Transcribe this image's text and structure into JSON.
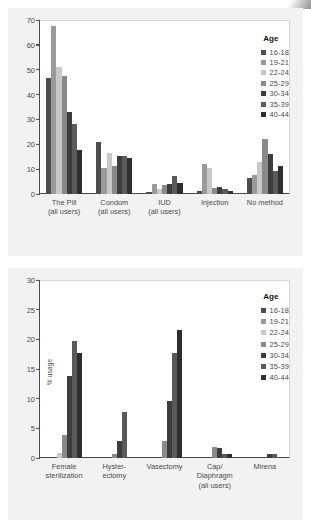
{
  "figure": {
    "background": "#f2f2f2",
    "panel_background": "#ffffff"
  },
  "legend": {
    "title": "Age",
    "entries": [
      {
        "label": "16-18",
        "color": "#4d4d4d"
      },
      {
        "label": "19-21",
        "color": "#9a9a9a"
      },
      {
        "label": "22-24",
        "color": "#c8c8c8"
      },
      {
        "label": "25-29",
        "color": "#8a8a8a"
      },
      {
        "label": "30-34",
        "color": "#3d3d3d"
      },
      {
        "label": "35-39",
        "color": "#5a5a5a"
      },
      {
        "label": "40-44",
        "color": "#2e2e2e"
      }
    ]
  },
  "chart_data": [
    {
      "type": "bar",
      "title": "",
      "xlabel": "",
      "ylabel": "% usage",
      "ylim": [
        0,
        70
      ],
      "yticks": [
        0,
        10,
        20,
        30,
        40,
        50,
        60,
        70
      ],
      "grid": false,
      "legend_position": "top-right",
      "categories": [
        "The Pill\n(all users)",
        "Condom\n(all users)",
        "IUD\n(all users)",
        "Injection",
        "No method"
      ],
      "category_lines": [
        [
          "The Pill",
          "(all users)"
        ],
        [
          "Condom",
          "(all users)"
        ],
        [
          "IUD",
          "(all users)"
        ],
        [
          "Injection",
          ""
        ],
        [
          "No method",
          ""
        ]
      ],
      "series": [
        {
          "name": "16-18",
          "color": "#4d4d4d",
          "values": [
            46.5,
            21.0,
            0.8,
            1.2,
            6.5
          ]
        },
        {
          "name": "19-21",
          "color": "#9a9a9a",
          "values": [
            67.5,
            10.5,
            4.0,
            12.0,
            7.5
          ]
        },
        {
          "name": "22-24",
          "color": "#c8c8c8",
          "values": [
            51.0,
            16.5,
            2.2,
            10.3,
            13.0
          ]
        },
        {
          "name": "25-29",
          "color": "#8a8a8a",
          "values": [
            47.5,
            11.3,
            3.6,
            2.6,
            22.3
          ]
        },
        {
          "name": "30-34",
          "color": "#3d3d3d",
          "values": [
            33.0,
            15.3,
            4.2,
            3.0,
            16.2
          ]
        },
        {
          "name": "35-39",
          "color": "#5a5a5a",
          "values": [
            28.0,
            15.2,
            7.2,
            2.0,
            9.4
          ]
        },
        {
          "name": "40-44",
          "color": "#2e2e2e",
          "values": [
            17.6,
            14.5,
            4.4,
            1.2,
            11.2
          ]
        }
      ]
    },
    {
      "type": "bar",
      "title": "",
      "xlabel": "",
      "ylabel": "% usage",
      "ylim": [
        0,
        30
      ],
      "yticks": [
        0,
        5,
        10,
        15,
        20,
        25,
        30
      ],
      "grid": false,
      "legend_position": "top-right",
      "categories": [
        "Female\nsterilization",
        "Hyster-\nectomy",
        "Vasectomy",
        "Cap/\nDiaphragm\n(all users)",
        "Mirena"
      ],
      "category_lines": [
        [
          "Female",
          "sterilization",
          ""
        ],
        [
          "Hyster-",
          "ectomy",
          ""
        ],
        [
          "Vasectomy",
          "",
          ""
        ],
        [
          "Cap/",
          "Diaphragm",
          "(all users)"
        ],
        [
          "Mirena",
          "",
          ""
        ]
      ],
      "series": [
        {
          "name": "16-18",
          "color": "#4d4d4d",
          "values": [
            0,
            0,
            0,
            0,
            0
          ]
        },
        {
          "name": "19-21",
          "color": "#9a9a9a",
          "values": [
            0,
            0,
            0,
            0,
            0
          ]
        },
        {
          "name": "22-24",
          "color": "#c8c8c8",
          "values": [
            0.9,
            0,
            0,
            0,
            0
          ]
        },
        {
          "name": "25-29",
          "color": "#8a8a8a",
          "values": [
            3.9,
            0.7,
            2.8,
            1.8,
            0
          ]
        },
        {
          "name": "30-34",
          "color": "#3d3d3d",
          "values": [
            13.8,
            2.9,
            9.6,
            1.7,
            0.6
          ]
        },
        {
          "name": "35-39",
          "color": "#5a5a5a",
          "values": [
            19.7,
            7.8,
            17.7,
            0.7,
            0.6
          ]
        },
        {
          "name": "40-44",
          "color": "#2e2e2e",
          "values": [
            17.7,
            0,
            21.6,
            0.7,
            0
          ]
        }
      ]
    }
  ]
}
